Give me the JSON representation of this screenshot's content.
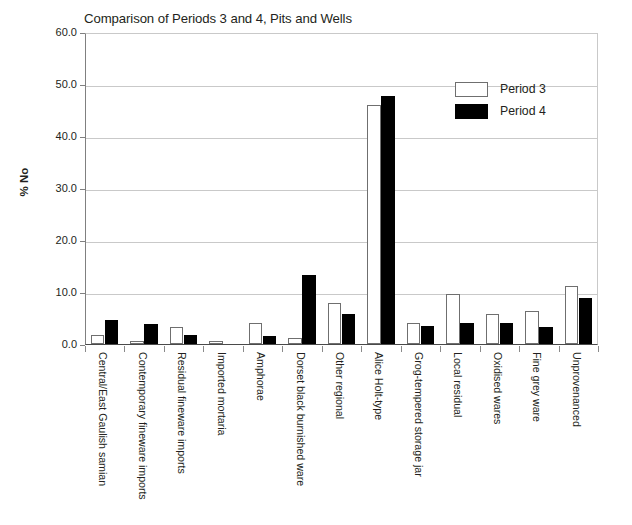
{
  "chart_data": {
    "type": "bar",
    "title": "Comparison of Periods 3 and 4, Pits and Wells",
    "xlabel": "",
    "ylabel": "% No",
    "ylim": [
      0.0,
      60.0
    ],
    "ytick_step": 10.0,
    "ytick_labels": [
      "60.0",
      "50.0",
      "40.0",
      "30.0",
      "20.0",
      "10.0",
      "0.0"
    ],
    "ytick_values": [
      60.0,
      50.0,
      40.0,
      30.0,
      20.0,
      10.0,
      0.0
    ],
    "grid": true,
    "legend_position": "upper right",
    "categories": [
      "Central/East Gaulish samian",
      "Contemporary fineware imports",
      "Residual fineware imports",
      "Imported mortaria",
      "Amphorae",
      "Dorset black burnished ware",
      "Other regional",
      "Alice Holt-type",
      "Grog-tempered storage jar",
      "Local residual",
      "Oxidised wares",
      "Fine grey ware",
      "Unprovenanced"
    ],
    "series": [
      {
        "name": "Period 3",
        "color": "#ffffff",
        "edge_color": "#6f6f6f",
        "values": [
          1.7,
          0.5,
          3.2,
          0.5,
          4.0,
          1.1,
          7.9,
          45.9,
          4.1,
          9.6,
          5.7,
          6.3,
          11.2
        ]
      },
      {
        "name": "Period 4",
        "color": "#000000",
        "edge_color": "#000000",
        "values": [
          4.7,
          3.8,
          1.8,
          0.0,
          1.6,
          13.2,
          5.7,
          47.6,
          3.4,
          4.0,
          4.0,
          3.3,
          8.9
        ]
      }
    ]
  }
}
